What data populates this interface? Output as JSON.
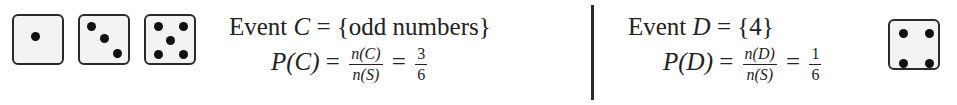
{
  "left_panel": {
    "dice": [
      {
        "label": "die-face-1",
        "pips": 1
      },
      {
        "label": "die-face-3",
        "pips": 3
      },
      {
        "label": "die-face-5",
        "pips": 5
      }
    ],
    "event_word": "Event",
    "event_var": "C",
    "equals": "=",
    "event_set": "{odd numbers}",
    "prob_lhs_P": "P",
    "prob_lhs_var": "(C)",
    "frac1_num": "n(C)",
    "frac1_den": "n(S)",
    "frac2_num": "3",
    "frac2_den": "6"
  },
  "right_panel": {
    "event_word": "Event",
    "event_var": "D",
    "equals": "=",
    "event_set": "{4}",
    "prob_lhs_P": "P",
    "prob_lhs_var": "(D)",
    "frac1_num": "n(D)",
    "frac1_den": "n(S)",
    "frac2_num": "1",
    "frac2_den": "6",
    "dice": [
      {
        "label": "die-face-4",
        "pips": 4
      }
    ]
  }
}
